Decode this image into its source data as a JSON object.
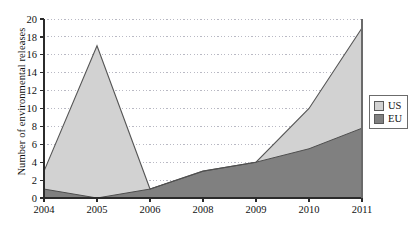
{
  "chart_data": {
    "type": "area",
    "stacked": true,
    "title": "",
    "xlabel": "",
    "ylabel": "Number of environmental releases",
    "categories": [
      "2004",
      "2005",
      "2006",
      "2008",
      "2009",
      "2010",
      "2011"
    ],
    "series": [
      {
        "name": "US",
        "values": [
          2,
          17,
          0,
          0,
          0,
          4.5,
          11.2
        ],
        "color": "#d2d2d2"
      },
      {
        "name": "EU",
        "values": [
          1,
          0,
          1,
          3,
          4,
          5.5,
          7.8
        ],
        "color": "#808080"
      }
    ],
    "cumulative_totals": [
      3,
      17,
      1,
      3,
      4,
      10,
      19
    ],
    "ylim": [
      0,
      20
    ],
    "ytick_labels": [
      "0",
      "2",
      "4",
      "6",
      "8",
      "10",
      "12",
      "14",
      "16",
      "18",
      "20"
    ],
    "ytick_values": [
      0,
      2,
      4,
      6,
      8,
      10,
      12,
      14,
      16,
      18,
      20
    ],
    "grid": "horizontal-dotted",
    "legend_position": "right",
    "legend_entries": [
      "US",
      "EU"
    ]
  },
  "axes": {
    "y_title": "Number of environmental releases"
  },
  "legend": {
    "items": [
      {
        "label": "US",
        "color": "#d2d2d2"
      },
      {
        "label": "EU",
        "color": "#808080"
      }
    ]
  },
  "colors": {
    "us_fill": "#d2d2d2",
    "eu_fill": "#808080",
    "outline": "#555555",
    "grid": "#b9b9c4",
    "axis": "#2b2b2b"
  }
}
